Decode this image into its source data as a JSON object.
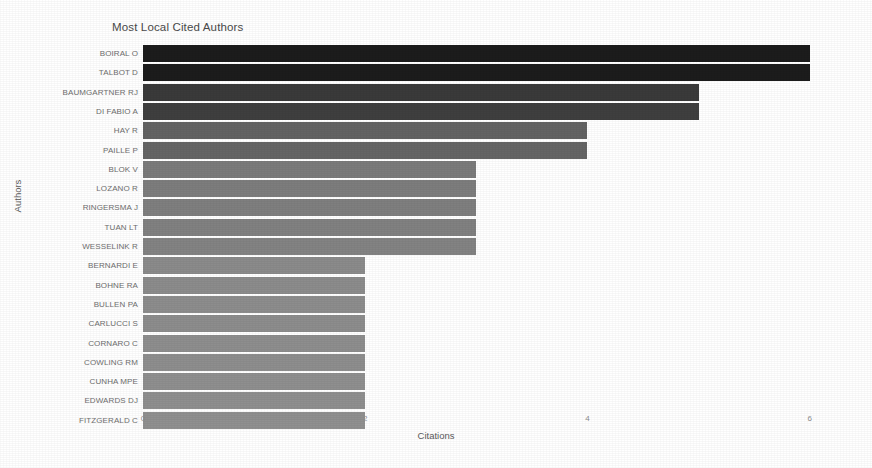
{
  "chart_data": {
    "type": "bar",
    "orientation": "horizontal",
    "title": "Most Local Cited Authors",
    "xlabel": "Citations",
    "ylabel": "Authors",
    "xlim": [
      0,
      6.3
    ],
    "xticks": [
      0,
      2,
      4,
      6
    ],
    "xtick_labels": [
      "0",
      "2",
      "4",
      "6"
    ],
    "grid": false,
    "legend": null,
    "categories": [
      "BOIRAL O",
      "TALBOT D",
      "BAUMGARTNER RJ",
      "DI FABIO A",
      "HAY R",
      "PAILLE P",
      "BLOK V",
      "LOZANO R",
      "RINGERSMA J",
      "TUAN LT",
      "WESSELINK R",
      "BERNARDI E",
      "BOHNE RA",
      "BULLEN PA",
      "CARLUCCI S",
      "CORNARO C",
      "COWLING RM",
      "CUNHA MPE",
      "EDWARDS DJ",
      "FITZGERALD C"
    ],
    "values": [
      6,
      6,
      5,
      5,
      4,
      4,
      3,
      3,
      3,
      3,
      3,
      2,
      2,
      2,
      2,
      2,
      2,
      2,
      2,
      2
    ],
    "bar_colors": [
      "#1c1c1c",
      "#1c1c1c",
      "#3a3a3a",
      "#3f3f3f",
      "#636363",
      "#656565",
      "#7b7b7b",
      "#7d7d7d",
      "#7f7f7f",
      "#818181",
      "#838383",
      "#8b8b8b",
      "#8c8c8c",
      "#8d8d8d",
      "#8d8d8d",
      "#8e8e8e",
      "#8e8e8e",
      "#8f8f8f",
      "#8f8f8f",
      "#909090"
    ]
  }
}
